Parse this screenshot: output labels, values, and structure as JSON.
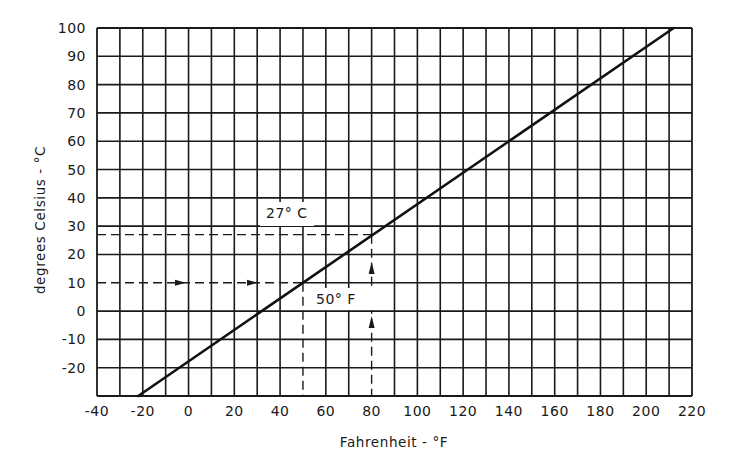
{
  "chart_data": {
    "type": "line",
    "title": "",
    "xlabel": "Fahrenheit - °F",
    "ylabel": "degrees Celsius - °C",
    "xlim": [
      -40,
      220
    ],
    "ylim": [
      -30,
      100
    ],
    "x_ticks": [
      -40,
      -20,
      0,
      20,
      40,
      60,
      80,
      100,
      120,
      140,
      160,
      180,
      200,
      220
    ],
    "x_tick_labels": [
      "-40",
      "-20",
      "0",
      "20",
      "40",
      "60",
      "80",
      "100",
      "120",
      "140",
      "160",
      "180",
      "200",
      "220"
    ],
    "x_minor_step": 10,
    "y_ticks": [
      -20,
      -10,
      0,
      10,
      20,
      30,
      40,
      50,
      60,
      70,
      80,
      90,
      100
    ],
    "y_tick_labels": [
      "-20",
      "-10",
      "0",
      "10",
      "20",
      "30",
      "40",
      "50",
      "60",
      "70",
      "80",
      "90",
      "100"
    ],
    "grid": true,
    "legend": null,
    "series": [
      {
        "name": "Celsius vs Fahrenheit conversion",
        "style": "solid",
        "x": [
          -22,
          212
        ],
        "y": [
          -30,
          100
        ]
      }
    ],
    "annotations": [
      {
        "text": "27° C",
        "description": "Dashed horizontal guide at 27 °C from y-axis to the conversion line at 80 °F; dashed vertical guide from x-axis up at 80 °F with upward arrows",
        "guide_x": 80,
        "guide_y": 27,
        "label_at": {
          "x": -8,
          "y": 33
        }
      },
      {
        "text": "50° F",
        "description": "Dashed horizontal guide at 10 °C from y-axis with rightward arrows to the conversion line at 50 °F; dashed vertical guide down to x-axis at 50 °F",
        "guide_x": 50,
        "guide_y": 10,
        "label_at": {
          "x": 52,
          "y": 5
        }
      }
    ]
  },
  "labels": {
    "x_axis_title": "Fahrenheit - °F",
    "y_axis_title": "degrees Celsius - °C",
    "annotation_celsius": "27° C",
    "annotation_fahrenheit": "50° F"
  }
}
